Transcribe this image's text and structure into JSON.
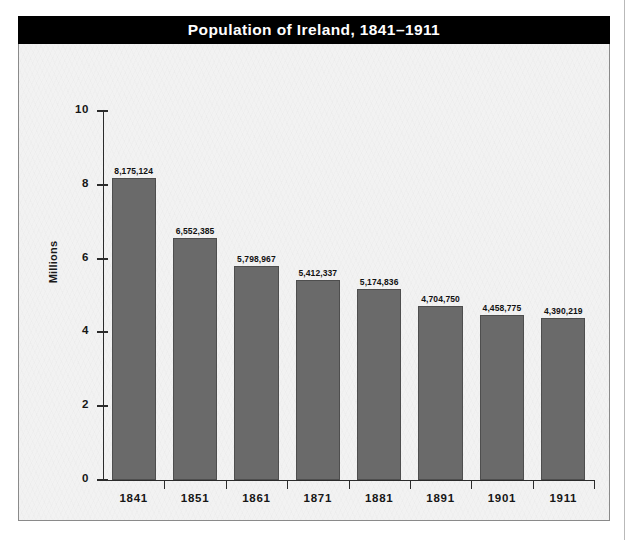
{
  "chart_data": {
    "type": "bar",
    "title": "Population of Ireland, 1841–1911",
    "xlabel": "",
    "ylabel": "Millions",
    "categories": [
      "1841",
      "1851",
      "1861",
      "1871",
      "1881",
      "1891",
      "1901",
      "1911"
    ],
    "values": [
      8175124,
      6552385,
      5798967,
      5412337,
      5174836,
      4704750,
      4458775,
      4390219
    ],
    "value_labels": [
      "8,175,124",
      "6,552,385",
      "5,798,967",
      "5,412,337",
      "5,174,836",
      "4,704,750",
      "4,458,775",
      "4,390,219"
    ],
    "ylim": [
      0,
      10
    ],
    "yticks": [
      0,
      2,
      4,
      6,
      8,
      10
    ],
    "ytick_labels": [
      "0",
      "2",
      "4",
      "6",
      "8",
      "10"
    ],
    "grid": false,
    "legend": null,
    "units": "millions",
    "colors": {
      "bar_fill": "#6a6a6a",
      "bar_edge": "#4e4e4e",
      "title_bar": "#000000",
      "title_text": "#ffffff",
      "panel_background": "#f2f2f2",
      "axis": "#2b2b2b",
      "panel_border": "#8a8a8a"
    }
  }
}
